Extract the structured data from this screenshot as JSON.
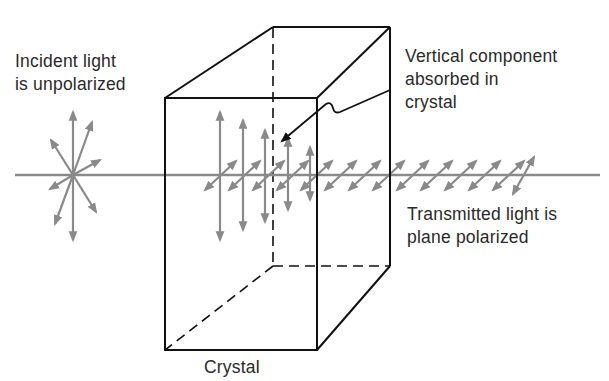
{
  "labels": {
    "incident_line1": "Incident light",
    "incident_line2": "is unpolarized",
    "absorbed_line1": "Vertical component",
    "absorbed_line2": "absorbed in",
    "absorbed_line3": "crystal",
    "transmitted_line1": "Transmitted light is",
    "transmitted_line2": "plane polarized",
    "crystal": "Crystal"
  },
  "colors": {
    "beam": "#8a8a8a",
    "outline": "#111111",
    "text": "#2a2a2a"
  },
  "elements": {
    "incident_beam": "unpolarized-starburst",
    "crystal_box": "rectangular-prism",
    "vertical_components": 5,
    "transmitted_components": "diagonal-double-arrows"
  }
}
